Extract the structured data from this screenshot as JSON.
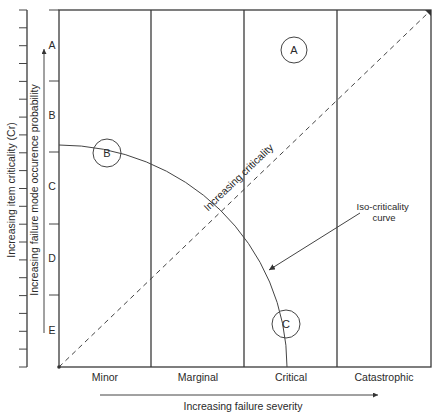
{
  "diagram": {
    "y_axis_outer_label": "Increasing item criticality (Cr)",
    "y_axis_inner_label": "Increasing failure mode occurence probability",
    "x_axis_label": "Increasing failure severity",
    "probability_levels": [
      "A",
      "B",
      "C",
      "D",
      "E"
    ],
    "severity_categories": [
      "Minor",
      "Marginal",
      "Critical",
      "Catastrophic"
    ],
    "diagonal_label": "Increasing criticality",
    "curve_annotation_line1": "Iso-criticality",
    "curve_annotation_line2": "curve",
    "markers": [
      {
        "label": "A",
        "severity": "Critical",
        "probability_level": "A"
      },
      {
        "label": "B",
        "severity": "Minor",
        "probability_level": "B/C"
      },
      {
        "label": "C",
        "severity": "Critical",
        "probability_level": "E"
      }
    ],
    "colors": {
      "line": "#3a3a3a",
      "text": "#2a2a2a",
      "background": "#ffffff"
    }
  }
}
